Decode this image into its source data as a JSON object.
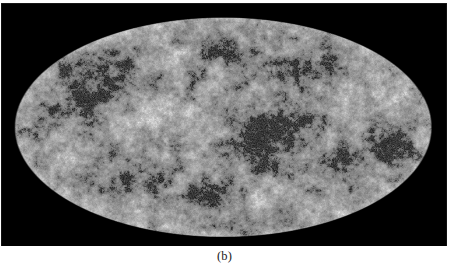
{
  "figure": {
    "panel_label": "(b)",
    "panel_kind": "all-sky-map",
    "projection": "mollweide",
    "colormap": "grayscale",
    "background_color": "#000000",
    "page_background_color": "#ffffff",
    "caption_color": "#1a1a1a",
    "panel": {
      "x": 1,
      "y": 3,
      "width": 446,
      "height": 243
    },
    "ellipse": {
      "center_x": 222,
      "center_y": 127,
      "semi_major_x": 209,
      "semi_minor_y": 110
    },
    "icons": {
      "sky_ellipse": "ellipse-sky-icon"
    }
  },
  "chart_data": {
    "type": "heatmap",
    "title": "",
    "subtitle": "",
    "xlabel": "",
    "ylabel": "",
    "projection": "mollweide",
    "grid": false,
    "legend": null,
    "colorbar": null,
    "colormap": "grayscale",
    "value_range_gray": [
      0,
      255
    ],
    "background_gray": 153,
    "texture": {
      "base_gray": 153,
      "speckle_amplitude": 52,
      "speckle_scale_px": 1.6,
      "smooth_scale_px": 5.0,
      "dark_spot_gray": 24,
      "bright_spot_gray": 236,
      "limb_brighten_gray": 18
    },
    "hot_cold_blobs": [
      {
        "name": "central-cold-cluster",
        "cx": 0.6,
        "cy": 0.55,
        "rx": 0.085,
        "ry": 0.14,
        "strength": -0.95
      },
      {
        "name": "upper-left-cold-band",
        "cx": 0.205,
        "cy": 0.255,
        "rx": 0.105,
        "ry": 0.115,
        "strength": -0.8
      },
      {
        "name": "left-mid-cold-patch",
        "cx": 0.155,
        "cy": 0.4,
        "rx": 0.065,
        "ry": 0.085,
        "strength": -0.55
      },
      {
        "name": "right-limb-cold-ring",
        "cx": 0.905,
        "cy": 0.585,
        "rx": 0.055,
        "ry": 0.085,
        "strength": -0.85
      },
      {
        "name": "right-lower-cold-arc",
        "cx": 0.805,
        "cy": 0.66,
        "rx": 0.085,
        "ry": 0.075,
        "strength": -0.7
      },
      {
        "name": "upper-right-cold-streak",
        "cx": 0.735,
        "cy": 0.235,
        "rx": 0.095,
        "ry": 0.07,
        "strength": -0.6
      },
      {
        "name": "upper-centre-cold-streak",
        "cx": 0.505,
        "cy": 0.175,
        "rx": 0.075,
        "ry": 0.055,
        "strength": -0.5
      },
      {
        "name": "lower-left-cold-patch",
        "cx": 0.275,
        "cy": 0.745,
        "rx": 0.08,
        "ry": 0.075,
        "strength": -0.6
      },
      {
        "name": "lower-centre-cold-patch",
        "cx": 0.455,
        "cy": 0.805,
        "rx": 0.09,
        "ry": 0.065,
        "strength": -0.55
      },
      {
        "name": "mid-right-cold-patch",
        "cx": 0.675,
        "cy": 0.455,
        "rx": 0.07,
        "ry": 0.07,
        "strength": -0.55
      },
      {
        "name": "far-left-cold-edge",
        "cx": 0.055,
        "cy": 0.525,
        "rx": 0.045,
        "ry": 0.09,
        "strength": -0.45
      },
      {
        "name": "centre-left-warm-void",
        "cx": 0.375,
        "cy": 0.455,
        "rx": 0.085,
        "ry": 0.095,
        "strength": 0.45
      },
      {
        "name": "upper-left-warm-void",
        "cx": 0.355,
        "cy": 0.195,
        "rx": 0.07,
        "ry": 0.06,
        "strength": 0.4
      },
      {
        "name": "lower-right-warm-void",
        "cx": 0.615,
        "cy": 0.805,
        "rx": 0.085,
        "ry": 0.07,
        "strength": 0.38
      },
      {
        "name": "right-upper-warm-void",
        "cx": 0.875,
        "cy": 0.355,
        "rx": 0.07,
        "ry": 0.085,
        "strength": 0.35
      },
      {
        "name": "left-lower-warm-void",
        "cx": 0.145,
        "cy": 0.625,
        "rx": 0.07,
        "ry": 0.08,
        "strength": 0.32
      }
    ]
  }
}
